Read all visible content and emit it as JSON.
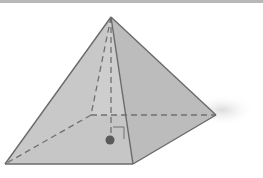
{
  "diagram": {
    "type": "square-pyramid",
    "vertices": {
      "apex": [
        111,
        17
      ],
      "front_left": [
        5,
        164
      ],
      "front_right": [
        133,
        164
      ],
      "back_right": [
        216,
        115
      ],
      "back_left": [
        91,
        115
      ],
      "base_center": [
        111,
        140
      ]
    },
    "colors": {
      "edge": "#6e6e6e",
      "left_face": "#d2d2d2",
      "front_face": "#c4c4c4",
      "right_face": "#bdbdbd",
      "base": "#c9c9c9",
      "dot": "#5a5a5a",
      "shadow": "#e6e6e6"
    },
    "annotations": {
      "height_line": "dashed",
      "right_angle_marker": true,
      "center_point": true
    }
  }
}
